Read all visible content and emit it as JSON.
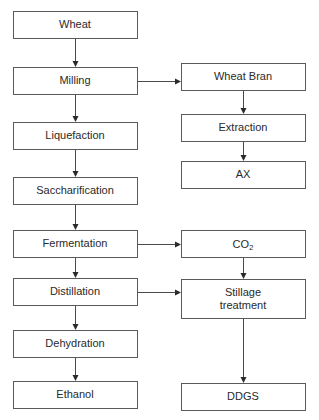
{
  "colors": {
    "stroke": "#5a5a5a",
    "arrow": "#2a2a2a",
    "text": "#2a2a2a",
    "background": "#ffffff"
  },
  "nodes": [
    {
      "id": "wheat",
      "label": [
        "Wheat"
      ],
      "column": "main"
    },
    {
      "id": "milling",
      "label": [
        "Milling"
      ],
      "column": "main"
    },
    {
      "id": "liquefaction",
      "label": [
        "Liquefaction"
      ],
      "column": "main"
    },
    {
      "id": "saccharification",
      "label": [
        "Saccharification"
      ],
      "column": "main"
    },
    {
      "id": "fermentation",
      "label": [
        "Fermentation"
      ],
      "column": "main"
    },
    {
      "id": "distillation",
      "label": [
        "Distillation"
      ],
      "column": "main"
    },
    {
      "id": "dehydration",
      "label": [
        "Dehydration"
      ],
      "column": "main"
    },
    {
      "id": "ethanol",
      "label": [
        "Ethanol"
      ],
      "column": "main"
    },
    {
      "id": "wheat-bran",
      "label": [
        "Wheat Bran"
      ],
      "column": "side"
    },
    {
      "id": "extraction",
      "label": [
        "Extraction"
      ],
      "column": "side"
    },
    {
      "id": "ax",
      "label": [
        "AX"
      ],
      "column": "side"
    },
    {
      "id": "co2",
      "label": [
        "CO",
        "2"
      ],
      "column": "side",
      "subscript": true
    },
    {
      "id": "stillage-treatment",
      "label": [
        "Stillage",
        "treatment"
      ],
      "column": "side"
    },
    {
      "id": "ddgs",
      "label": [
        "DDGS"
      ],
      "column": "side"
    }
  ],
  "edges": [
    {
      "from": "wheat",
      "to": "milling"
    },
    {
      "from": "milling",
      "to": "liquefaction"
    },
    {
      "from": "liquefaction",
      "to": "saccharification"
    },
    {
      "from": "saccharification",
      "to": "fermentation"
    },
    {
      "from": "fermentation",
      "to": "distillation"
    },
    {
      "from": "distillation",
      "to": "dehydration"
    },
    {
      "from": "dehydration",
      "to": "ethanol"
    },
    {
      "from": "milling",
      "to": "wheat-bran"
    },
    {
      "from": "wheat-bran",
      "to": "extraction"
    },
    {
      "from": "extraction",
      "to": "ax"
    },
    {
      "from": "fermentation",
      "to": "co2"
    },
    {
      "from": "co2",
      "to": "stillage-treatment"
    },
    {
      "from": "distillation",
      "to": "stillage-treatment"
    },
    {
      "from": "stillage-treatment",
      "to": "ddgs"
    }
  ]
}
